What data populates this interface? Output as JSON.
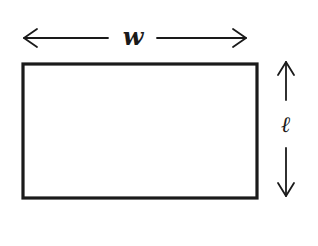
{
  "diagram": {
    "type": "rectangle-dimensions",
    "shape": "rectangle",
    "width_label": "w",
    "length_label": "ℓ",
    "stroke_color": "#1a1a1a",
    "background": "#ffffff"
  }
}
